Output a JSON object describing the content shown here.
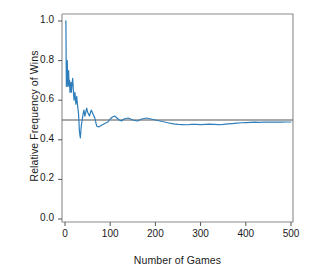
{
  "chart_data": {
    "type": "line",
    "title": "",
    "xlabel": "Number of Games",
    "ylabel": "Relative Frequency of Wins",
    "xlim": [
      0,
      520
    ],
    "ylim": [
      0.0,
      1.0
    ],
    "xticks": [
      0,
      100,
      200,
      300,
      400,
      500
    ],
    "xtick_labels": [
      "0",
      "100",
      "200",
      "300",
      "400",
      "500"
    ],
    "yticks": [
      0.0,
      0.2,
      0.4,
      0.6,
      0.8,
      1.0
    ],
    "ytick_labels": [
      "0.0",
      "0.2",
      "0.4",
      "0.6",
      "0.8",
      "1.0"
    ],
    "grid": false,
    "legend": "none",
    "series": [
      {
        "name": "Relative frequency of wins",
        "color": "#2E7EBB",
        "x": [
          1,
          2,
          3,
          4,
          5,
          6,
          7,
          8,
          9,
          10,
          11,
          12,
          13,
          14,
          15,
          16,
          17,
          18,
          19,
          20,
          21,
          22,
          23,
          24,
          25,
          26,
          27,
          28,
          29,
          30,
          32,
          34,
          36,
          38,
          40,
          42,
          44,
          46,
          48,
          50,
          54,
          58,
          62,
          66,
          70,
          74,
          78,
          82,
          86,
          90,
          95,
          100,
          105,
          110,
          115,
          120,
          125,
          130,
          140,
          150,
          160,
          170,
          180,
          190,
          200,
          210,
          220,
          230,
          240,
          250,
          260,
          270,
          280,
          290,
          300,
          310,
          320,
          330,
          340,
          350,
          360,
          370,
          380,
          390,
          400,
          410,
          420,
          430,
          440,
          450,
          460,
          470,
          480,
          490,
          500
        ],
        "y": [
          1.0,
          1.0,
          0.67,
          0.75,
          0.8,
          0.67,
          0.71,
          0.75,
          0.67,
          0.7,
          0.64,
          0.67,
          0.69,
          0.64,
          0.67,
          0.69,
          0.71,
          0.67,
          0.63,
          0.6,
          0.62,
          0.64,
          0.61,
          0.58,
          0.6,
          0.62,
          0.59,
          0.57,
          0.55,
          0.53,
          0.44,
          0.41,
          0.47,
          0.5,
          0.53,
          0.55,
          0.52,
          0.54,
          0.56,
          0.54,
          0.52,
          0.55,
          0.53,
          0.51,
          0.47,
          0.465,
          0.47,
          0.475,
          0.48,
          0.485,
          0.49,
          0.505,
          0.515,
          0.52,
          0.51,
          0.5,
          0.495,
          0.505,
          0.51,
          0.5,
          0.495,
          0.505,
          0.51,
          0.505,
          0.5,
          0.495,
          0.49,
          0.485,
          0.48,
          0.478,
          0.477,
          0.476,
          0.478,
          0.478,
          0.477,
          0.478,
          0.479,
          0.478,
          0.477,
          0.478,
          0.48,
          0.482,
          0.484,
          0.486,
          0.487,
          0.488,
          0.489,
          0.488,
          0.489,
          0.49,
          0.489,
          0.49,
          0.489,
          0.49,
          0.49
        ]
      }
    ],
    "reference_line": {
      "name": "Theoretical probability",
      "value": 0.5,
      "color": "#555555",
      "orientation": "horizontal"
    }
  },
  "axes": {
    "frame_color": "#888888",
    "tick_color": "#555555"
  }
}
